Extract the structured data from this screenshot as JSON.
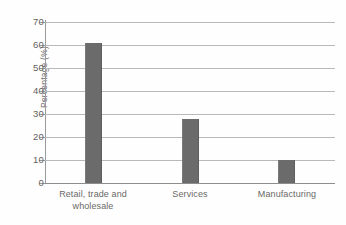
{
  "chart_data": {
    "type": "bar",
    "title": "",
    "xlabel": "",
    "ylabel": "Percentage (%)",
    "categories": [
      "Retail, trade and wholesale",
      "Services",
      "Manufacturing"
    ],
    "category_lines": [
      [
        "Retail, trade and",
        "wholesale"
      ],
      [
        "Services"
      ],
      [
        "Manufacturing"
      ]
    ],
    "values": [
      61,
      28,
      10
    ],
    "ylim": [
      0,
      70
    ],
    "ytick_values": [
      0,
      10,
      20,
      30,
      40,
      50,
      60,
      70
    ],
    "ytick_labels": [
      "0",
      "10",
      "20",
      "30",
      "40",
      "50",
      "60",
      "70"
    ],
    "grid": true,
    "legend": false,
    "bar_color": "#6b6b6b",
    "gridline_color": "#b9b9b9",
    "axis_color": "#9a9a9a",
    "text_color": "#6a6966"
  }
}
